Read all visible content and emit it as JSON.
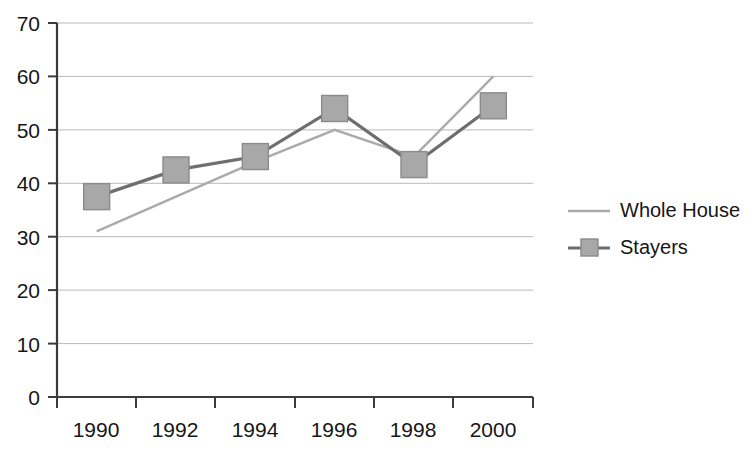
{
  "chart_data": {
    "type": "line",
    "title": "",
    "subtitle": "",
    "xlabel": "",
    "ylabel": "",
    "categories": [
      "1990",
      "1992",
      "1994",
      "1996",
      "1998",
      "2000"
    ],
    "ylim": [
      0,
      70
    ],
    "yticks": [
      0,
      10,
      20,
      30,
      40,
      50,
      60,
      70
    ],
    "ytick_labels": [
      "0",
      "10",
      "20",
      "30",
      "40",
      "50",
      "60",
      "70"
    ],
    "grid": "horizontal",
    "legend_position": "right",
    "series": [
      {
        "name": "Whole House",
        "marker": "none",
        "color": "#aaaaaa",
        "values": [
          31,
          37.5,
          44,
          50,
          45,
          60
        ]
      },
      {
        "name": "Stayers",
        "marker": "square",
        "color": "#6e6e6e",
        "values": [
          37.5,
          42.5,
          45,
          54,
          43.5,
          54.5
        ]
      }
    ]
  },
  "axes": {
    "y_ticks": [
      "70",
      "60",
      "50",
      "40",
      "30",
      "20",
      "10",
      "0"
    ],
    "x_ticks": [
      "1990",
      "1992",
      "1994",
      "1996",
      "1998",
      "2000"
    ]
  },
  "legend": {
    "items": [
      {
        "label": "Whole House",
        "marker": "line"
      },
      {
        "label": "Stayers",
        "marker": "line-square"
      }
    ]
  }
}
